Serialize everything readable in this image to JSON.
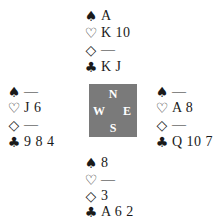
{
  "diagram": {
    "type": "bridge-deal",
    "compass": {
      "north": "N",
      "south": "S",
      "east": "E",
      "west": "W",
      "color": "#7a7a7a"
    },
    "suits": {
      "spades": "♠",
      "hearts": "♡",
      "diamonds": "◇",
      "clubs": "♣"
    },
    "hands": {
      "north": {
        "spades": "A",
        "hearts": "K 10",
        "diamonds": "—",
        "clubs": "K J"
      },
      "west": {
        "spades": "—",
        "hearts": "J 6",
        "diamonds": "—",
        "clubs": "9 8 4"
      },
      "east": {
        "spades": "—",
        "hearts": "A 8",
        "diamonds": "—",
        "clubs": "Q 10 7"
      },
      "south": {
        "spades": "8",
        "hearts": "—",
        "diamonds": "3",
        "clubs": "A 6 2"
      }
    }
  }
}
